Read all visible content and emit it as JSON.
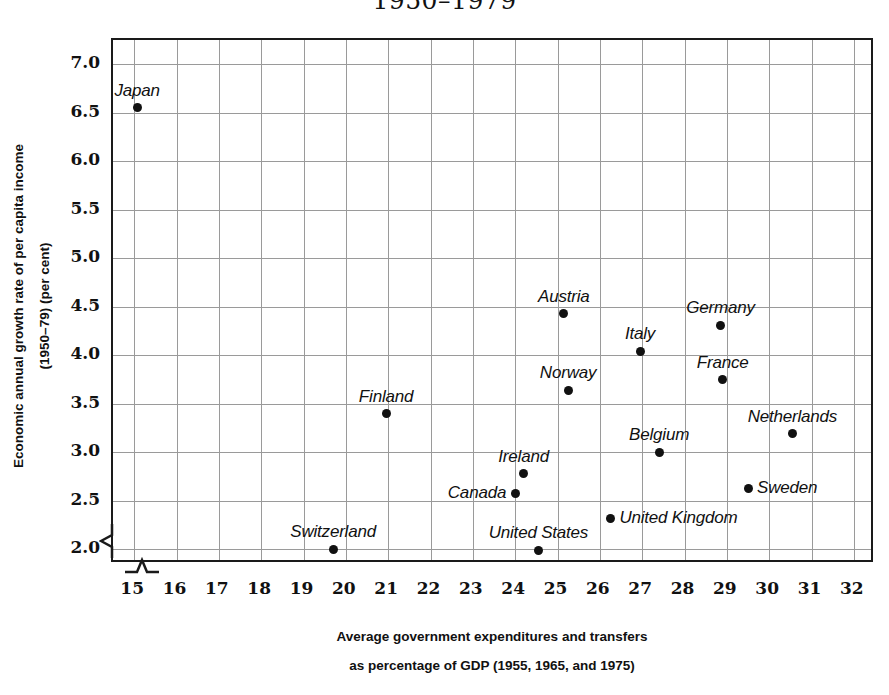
{
  "chart_data": {
    "type": "scatter",
    "title": "1950–1979",
    "xlabel_lines": [
      "Average government expenditures and transfers",
      "as percentage of GDP (1955, 1965, and 1975)"
    ],
    "ylabel_lines": [
      "Economic annual growth rate of per capita income",
      "(1950–79) (per cent)"
    ],
    "xlim": [
      14.5,
      32.5
    ],
    "ylim": [
      1.85,
      7.25
    ],
    "xticks": [
      15,
      16,
      17,
      18,
      19,
      20,
      21,
      22,
      23,
      24,
      25,
      26,
      27,
      28,
      29,
      30,
      31,
      32
    ],
    "yticks": [
      "7.0",
      "6.5",
      "6.0",
      "5.5",
      "5.0",
      "4.5",
      "4.0",
      "3.5",
      "3.0",
      "2.5",
      "2.0"
    ],
    "grid": true,
    "legend": "none",
    "axis_break_x": true,
    "axis_break_y": true,
    "marker_color": "#111111",
    "grid_color": "#9a9a9a",
    "frame_color": "#1a1a1a",
    "points": [
      {
        "name": "Japan",
        "x": 15.07,
        "y": 6.55,
        "label_pos": "above",
        "dx": 0,
        "dy": -7
      },
      {
        "name": "Austria",
        "x": 25.15,
        "y": 4.43,
        "label_pos": "above",
        "dx": 0,
        "dy": -7
      },
      {
        "name": "Germany",
        "x": 28.85,
        "y": 4.31,
        "label_pos": "above",
        "dx": 0,
        "dy": -7
      },
      {
        "name": "Italy",
        "x": 26.95,
        "y": 4.04,
        "label_pos": "above",
        "dx": 0,
        "dy": -7
      },
      {
        "name": "France",
        "x": 28.9,
        "y": 3.75,
        "label_pos": "above",
        "dx": 0,
        "dy": -7
      },
      {
        "name": "Norway",
        "x": 25.25,
        "y": 3.64,
        "label_pos": "above",
        "dx": 0,
        "dy": -7
      },
      {
        "name": "Finland",
        "x": 20.95,
        "y": 3.4,
        "label_pos": "above",
        "dx": 0,
        "dy": -7
      },
      {
        "name": "Netherlands",
        "x": 30.55,
        "y": 3.19,
        "label_pos": "above",
        "dx": 0,
        "dy": -7
      },
      {
        "name": "Belgium",
        "x": 27.4,
        "y": 3.0,
        "label_pos": "above",
        "dx": 0,
        "dy": -7
      },
      {
        "name": "Ireland",
        "x": 24.2,
        "y": 2.78,
        "label_pos": "above",
        "dx": 0,
        "dy": -7
      },
      {
        "name": "Sweden",
        "x": 29.5,
        "y": 2.63,
        "label_pos": "right",
        "dx": 9,
        "dy": 0
      },
      {
        "name": "Canada",
        "x": 24.0,
        "y": 2.58,
        "label_pos": "left",
        "dx": -9,
        "dy": 0
      },
      {
        "name": "United Kingdom",
        "x": 26.25,
        "y": 2.32,
        "label_pos": "right",
        "dx": 9,
        "dy": 0
      },
      {
        "name": "Switzerland",
        "x": 19.7,
        "y": 2.0,
        "label_pos": "above",
        "dx": 0,
        "dy": -7
      },
      {
        "name": "United States",
        "x": 24.55,
        "y": 1.99,
        "label_pos": "above",
        "dx": 0,
        "dy": -7
      }
    ]
  }
}
